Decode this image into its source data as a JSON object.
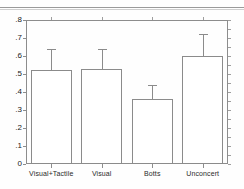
{
  "chart_data": {
    "type": "bar",
    "title": "",
    "subtitle": "",
    "xlabel": "",
    "ylabel": "",
    "categories": [
      "Visual+Tactile",
      "Visual",
      "Botts",
      "Unconcert"
    ],
    "values": [
      0.52,
      0.53,
      0.36,
      0.6
    ],
    "errors": [
      0.12,
      0.11,
      0.08,
      0.12
    ],
    "error_upper": [
      0.64,
      0.64,
      0.44,
      0.72
    ],
    "ylim": [
      0,
      0.8
    ],
    "ytick_values": [
      0,
      0.1,
      0.2,
      0.3,
      0.4,
      0.5,
      0.6,
      0.7,
      0.8
    ],
    "ytick_labels": [
      "0",
      ".1",
      ".2",
      ".3",
      ".4",
      ".5",
      ".6",
      ".7",
      ".8"
    ],
    "grid": false,
    "legend": null,
    "legend_position": "none",
    "bar_style": {
      "fill": "#ffffff",
      "edge": "#8b8b8b"
    },
    "error_bar_color": "#8b8b8b",
    "axis_color": "#8d8d8d",
    "background": "#fefefe",
    "annotations": []
  }
}
